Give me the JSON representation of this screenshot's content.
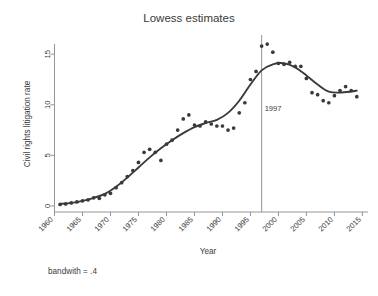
{
  "chart_data": {
    "type": "scatter",
    "title": "Lowess estimates",
    "xlabel": "Year",
    "ylabel": "Civil rights litigation rate",
    "note": "bandwith = .4",
    "grid": false,
    "legend": "none",
    "xlim": [
      1960,
      2016
    ],
    "ylim": [
      -0.6,
      16.6
    ],
    "xticks": [
      1960,
      1965,
      1970,
      1975,
      1980,
      1985,
      1990,
      1995,
      2000,
      2005,
      2010,
      2015
    ],
    "xtick_labels": [
      "1960",
      "1965",
      "1970",
      "1975",
      "1980",
      "1985",
      "1990",
      "1995",
      "2000",
      "2005",
      "2010",
      "2015"
    ],
    "yticks": [
      0,
      5,
      10,
      15
    ],
    "ytick_labels": [
      "0",
      "5",
      "10",
      "15"
    ],
    "series": [
      {
        "name": "Civil rights litigation rate (observed)",
        "type": "scatter",
        "marker": "filled-circle",
        "color": "#3a3a3a",
        "x": [
          1961,
          1962,
          1963,
          1964,
          1965,
          1966,
          1967,
          1968,
          1969,
          1970,
          1971,
          1972,
          1973,
          1974,
          1975,
          1976,
          1977,
          1978,
          1979,
          1980,
          1981,
          1982,
          1983,
          1984,
          1985,
          1986,
          1987,
          1988,
          1989,
          1990,
          1991,
          1992,
          1993,
          1994,
          1995,
          1996,
          1997,
          1998,
          1999,
          2000,
          2001,
          2002,
          2003,
          2004,
          2005,
          2006,
          2007,
          2008,
          2009,
          2010,
          2011,
          2012,
          2013,
          2014
        ],
        "y": [
          0.15,
          0.2,
          0.3,
          0.4,
          0.5,
          0.6,
          0.8,
          0.75,
          1.1,
          1.25,
          1.8,
          2.3,
          2.9,
          3.5,
          4.3,
          5.3,
          5.6,
          5.3,
          4.5,
          6.1,
          6.5,
          7.5,
          8.6,
          9.0,
          8.0,
          7.9,
          8.3,
          8.1,
          7.9,
          7.9,
          7.5,
          7.7,
          9.2,
          10.2,
          12.5,
          13.3,
          15.8,
          16.0,
          15.2,
          14.1,
          14.0,
          14.2,
          13.8,
          13.8,
          12.6,
          11.2,
          11.0,
          10.4,
          10.2,
          10.9,
          11.4,
          11.8,
          11.4,
          10.8
        ]
      },
      {
        "name": "Lowess smooth (bandwidth .4)",
        "type": "line",
        "color": "#3a3a3a",
        "x": [
          1961,
          1963,
          1965,
          1967,
          1969,
          1971,
          1973,
          1975,
          1977,
          1979,
          1981,
          1983,
          1985,
          1987,
          1989,
          1991,
          1993,
          1995,
          1997,
          1999,
          2001,
          2003,
          2005,
          2007,
          2009,
          2011,
          2013,
          2014
        ],
        "y": [
          0.2,
          0.3,
          0.5,
          0.8,
          1.2,
          1.9,
          2.8,
          3.8,
          4.8,
          5.7,
          6.5,
          7.2,
          7.8,
          8.2,
          8.5,
          9.2,
          10.4,
          12.0,
          13.4,
          14.0,
          14.1,
          13.7,
          12.9,
          12.0,
          11.3,
          11.2,
          11.3,
          11.4
        ]
      }
    ],
    "annotations": [
      {
        "name": "reference-line-1997",
        "type": "vline",
        "x": 1997,
        "label": "1997",
        "label_y": 9.35,
        "color": "#8a8a8a"
      }
    ]
  }
}
